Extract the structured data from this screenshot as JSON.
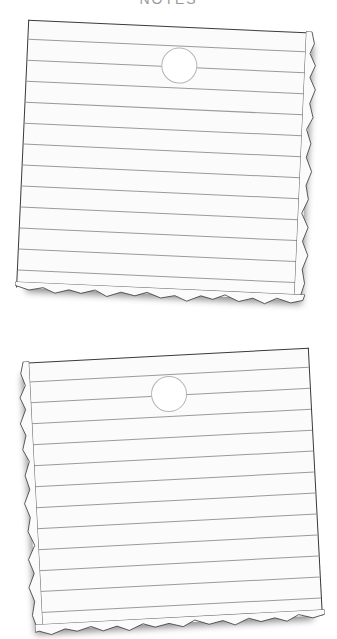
{
  "caption": "NOTES",
  "notes": [
    {
      "id": "note-1",
      "ruled_lines": 12,
      "line_spacing_px": 21,
      "first_line_offset_px": 18,
      "hole": {
        "left_px": 134,
        "top_px": 20
      },
      "torn_edges": [
        "right",
        "bottom"
      ],
      "rotation_deg": 2.6
    },
    {
      "id": "note-2",
      "ruled_lines": 12,
      "line_spacing_px": 21,
      "first_line_offset_px": 18,
      "hole": {
        "left_px": 126,
        "top_px": 20
      },
      "torn_edges": [
        "left",
        "bottom"
      ],
      "rotation_deg": -3
    }
  ],
  "colors": {
    "paper": "#fbfbfb",
    "rule_line": "#9a9a9a",
    "border": "#3a3a3a",
    "hole_border": "#b5b5b5",
    "background": "#ffffff"
  }
}
